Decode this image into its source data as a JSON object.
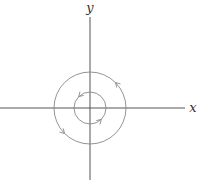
{
  "figure": {
    "type": "phase-portrait",
    "colors": {
      "background": "#ffffff",
      "axes": "#555555",
      "orbits": "#888888",
      "labels": "#333333"
    },
    "origin": {
      "x": 90,
      "y": 108
    },
    "axes": {
      "x": {
        "label": "x",
        "x1": 0,
        "x2": 185,
        "y": 108,
        "label_x": 193,
        "label_y": 112
      },
      "y": {
        "label": "y",
        "y1": 17,
        "y2": 180,
        "x": 90,
        "label_x": 90,
        "label_y": 12
      }
    },
    "orbits": [
      {
        "name": "inner",
        "radius": 16,
        "direction": "counterclockwise",
        "arrows": [
          {
            "angle_deg": 135
          },
          {
            "angle_deg": 315
          }
        ]
      },
      {
        "name": "outer",
        "radius": 36,
        "direction": "counterclockwise",
        "arrows": [
          {
            "angle_deg": 45
          },
          {
            "angle_deg": 225
          }
        ]
      }
    ]
  }
}
